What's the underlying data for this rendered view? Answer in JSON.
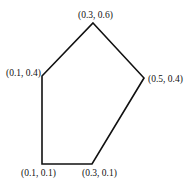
{
  "diagram": {
    "type": "polygon",
    "shape": "pentagon",
    "stroke_color": "#111111",
    "background": "#ffffff",
    "vertices": [
      {
        "label": "(0.3, 0.6)",
        "x": 0.3,
        "y": 0.6
      },
      {
        "label": "(0.5, 0.4)",
        "x": 0.5,
        "y": 0.4
      },
      {
        "label": "(0.3, 0.1)",
        "x": 0.3,
        "y": 0.1
      },
      {
        "label": "(0.1, 0.1)",
        "x": 0.1,
        "y": 0.1
      },
      {
        "label": "(0.1, 0.4)",
        "x": 0.1,
        "y": 0.4
      }
    ]
  }
}
